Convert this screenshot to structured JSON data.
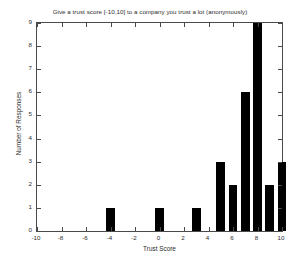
{
  "chart_data": {
    "type": "bar",
    "title": "Give a trust score [-10,10] to a company you trust a lot  (anonymously)",
    "xlabel": "Trust Score",
    "ylabel": "Number of Responses",
    "xlim": [
      -10,
      10
    ],
    "ylim": [
      0,
      9
    ],
    "xticks": [
      -10,
      -8,
      -6,
      -4,
      -2,
      0,
      2,
      4,
      6,
      8,
      10
    ],
    "xticklabels": [
      "-10",
      "-8",
      "-6",
      "-4",
      "-2",
      "0",
      "2",
      "4",
      "6",
      "8",
      "10"
    ],
    "yticks": [
      0,
      1,
      2,
      3,
      4,
      5,
      6,
      7,
      8,
      9
    ],
    "yticklabels": [
      "0",
      "1",
      "2",
      "3",
      "4",
      "5",
      "6",
      "7",
      "8",
      "9"
    ],
    "grid": false,
    "legend": false,
    "bar_color": "#000000",
    "bar_width": 0.7,
    "categories": [
      -4,
      0,
      3,
      5,
      6,
      7,
      8,
      9,
      10
    ],
    "values": [
      1,
      1,
      1,
      3,
      2,
      6,
      9,
      2,
      3
    ],
    "bars": [
      {
        "x": -4,
        "value": 1
      },
      {
        "x": 0,
        "value": 1
      },
      {
        "x": 3,
        "value": 1
      },
      {
        "x": 5,
        "value": 3
      },
      {
        "x": 6,
        "value": 2
      },
      {
        "x": 7,
        "value": 6
      },
      {
        "x": 8,
        "value": 9
      },
      {
        "x": 9,
        "value": 2
      },
      {
        "x": 10,
        "value": 3
      }
    ]
  }
}
